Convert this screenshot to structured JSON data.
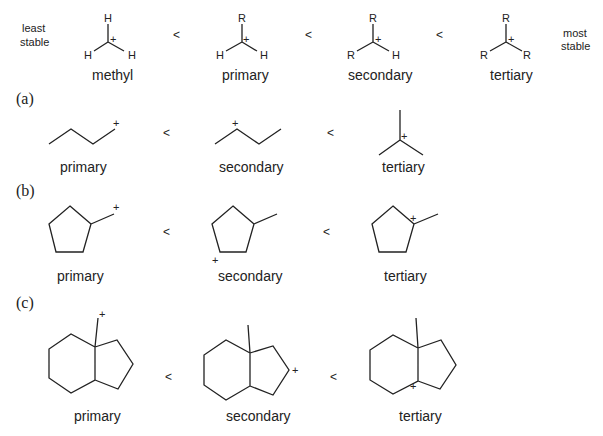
{
  "figure": {
    "top_row": {
      "left_label_line1": "least",
      "left_label_line2": "stable",
      "right_label_line1": "most",
      "right_label_line2": "stable",
      "comparator": "<",
      "cations": [
        {
          "name": "methyl",
          "substituents": {
            "top": "H",
            "left": "H",
            "right": "H"
          },
          "charge": "+"
        },
        {
          "name": "primary",
          "substituents": {
            "top": "R",
            "left": "H",
            "right": "H"
          },
          "charge": "+"
        },
        {
          "name": "secondary",
          "substituents": {
            "top": "R",
            "left": "R",
            "right": "H"
          },
          "charge": "+"
        },
        {
          "name": "tertiary",
          "substituents": {
            "top": "R",
            "left": "R",
            "right": "R"
          },
          "charge": "+"
        }
      ]
    },
    "sections": [
      {
        "label": "(a)",
        "comparator": "<",
        "structures": [
          {
            "name": "primary",
            "charge": "+"
          },
          {
            "name": "secondary",
            "charge": "+"
          },
          {
            "name": "tertiary",
            "charge": "+"
          }
        ]
      },
      {
        "label": "(b)",
        "comparator": "<",
        "structures": [
          {
            "name": "primary",
            "charge": "+"
          },
          {
            "name": "secondary",
            "charge": "+"
          },
          {
            "name": "tertiary",
            "charge": "+"
          }
        ]
      },
      {
        "label": "(c)",
        "comparator": "<",
        "structures": [
          {
            "name": "primary",
            "charge": "+"
          },
          {
            "name": "secondary",
            "charge": "+"
          },
          {
            "name": "tertiary",
            "charge": "+"
          }
        ]
      }
    ]
  }
}
